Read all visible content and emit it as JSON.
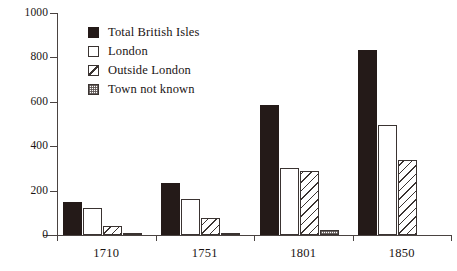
{
  "chart_data": {
    "type": "bar",
    "title": "",
    "subtitle": "",
    "xlabel": "",
    "ylabel": "",
    "categories": [
      "1710",
      "1751",
      "1801",
      "1850"
    ],
    "series": [
      {
        "name": "Total British Isles",
        "values": [
          150,
          235,
          585,
          835
        ],
        "swatch": "solid-black"
      },
      {
        "name": "London",
        "values": [
          120,
          160,
          300,
          495
        ],
        "swatch": "white-outline"
      },
      {
        "name": "Outside London",
        "values": [
          40,
          75,
          290,
          340
        ],
        "swatch": "diagonal-hatch"
      },
      {
        "name": "Town not known",
        "values": [
          10,
          10,
          22,
          0
        ],
        "swatch": "stipple-grey"
      }
    ],
    "ylim": [
      0,
      1000
    ],
    "ytick_values": [
      0,
      200,
      400,
      600,
      800,
      1000
    ],
    "ytick_labels": [
      "0",
      "200",
      "400",
      "600",
      "800",
      "1000"
    ],
    "grid": false,
    "legend_position": "top-left-inside"
  },
  "legend": {
    "items": [
      {
        "label": "Total British Isles"
      },
      {
        "label": "London"
      },
      {
        "label": "Outside London"
      },
      {
        "label": "Town not known"
      }
    ]
  },
  "colors": {
    "total_british_isles": "#241a18",
    "london": "#ffffff",
    "outside_london": "#ffffff",
    "town_not_known": "#ffffff",
    "axis": "#4a4341",
    "text": "#1a1413",
    "background": "#ffffff"
  }
}
